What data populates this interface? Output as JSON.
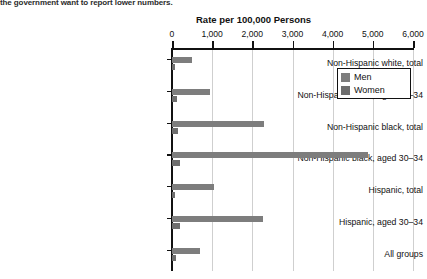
{
  "page": {
    "bleed_text_top": "the government want to report lower numbers.",
    "bleed_text_right": "",
    "ghost_lines": [
      "",
      ""
    ]
  },
  "legend": {
    "position": "top-right",
    "items": [
      {
        "label": "Men",
        "color": "#7d7d7d"
      },
      {
        "label": "Women",
        "color": "#6e6e6e"
      }
    ]
  },
  "chart_data": {
    "type": "bar",
    "orientation": "horizontal",
    "title": "",
    "xlabel": "Rate per 100,000 Persons",
    "ylabel": "",
    "xlim": [
      0,
      6000
    ],
    "grid": true,
    "xticks": [
      0,
      1000,
      2000,
      3000,
      4000,
      5000,
      6000
    ],
    "xtick_labels": [
      "0",
      "1,000",
      "2,000",
      "3,000",
      "4,000",
      "5,000",
      "6,000"
    ],
    "categories": [
      "Non-Hispanic white, total",
      "Non-Hispanic white, aged 30–34",
      "Non-Hispanic black, total",
      "Non-Hispanic black, aged 30–34",
      "Hispanic, total",
      "Hispanic, aged 30–34",
      "All groups"
    ],
    "series": [
      {
        "name": "Men",
        "color": "#7d7d7d",
        "values": [
          490,
          950,
          2300,
          4880,
          1050,
          2270,
          700
        ]
      },
      {
        "name": "Women",
        "color": "#6e6e6e",
        "values": [
          75,
          120,
          150,
          205,
          70,
          200,
          90
        ]
      }
    ]
  }
}
